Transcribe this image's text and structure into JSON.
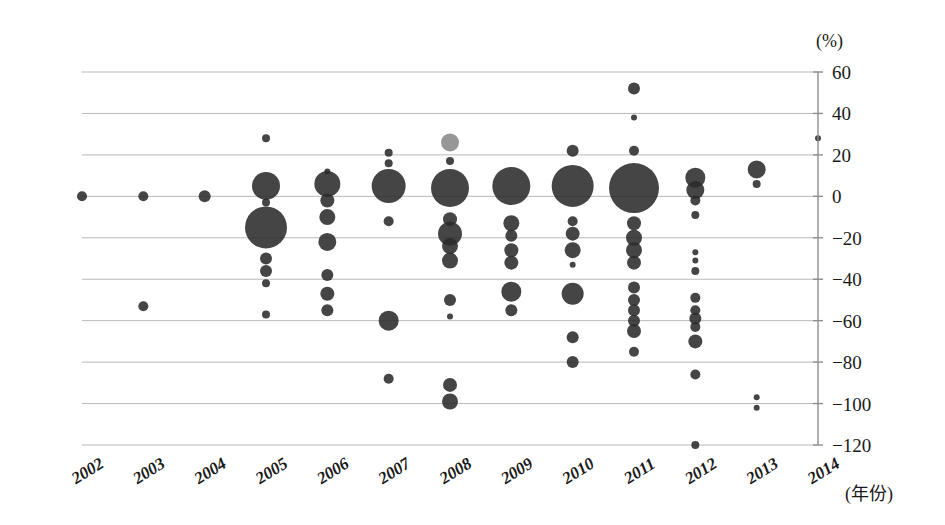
{
  "chart_data": {
    "type": "scatter",
    "title": "",
    "subtitle": "",
    "xlabel": "(年份)",
    "ylabel": "(%)",
    "y_unit": "(%)",
    "categories": [
      "2002",
      "2003",
      "2004",
      "2005",
      "2006",
      "2007",
      "2008",
      "2009",
      "2010",
      "2011",
      "2012",
      "2013",
      "2014"
    ],
    "xlim": [
      2002,
      2014
    ],
    "ylim": [
      -120,
      60
    ],
    "y_ticks": [
      60,
      40,
      20,
      0,
      -20,
      -40,
      -60,
      -80,
      -100,
      -120
    ],
    "y_tick_labels": [
      "60",
      "40",
      "20",
      "0",
      "-20",
      "-40",
      "-60",
      "-80",
      "-100",
      "-120"
    ],
    "grid": true,
    "legend": "none",
    "marker_note": "bubble size encodes magnitude",
    "series": [
      {
        "name": "2002",
        "points": [
          {
            "y": 0,
            "size": 5,
            "shade": "dark"
          }
        ]
      },
      {
        "name": "2003",
        "points": [
          {
            "y": 0,
            "size": 5,
            "shade": "dark"
          },
          {
            "y": -53,
            "size": 5,
            "shade": "dark"
          }
        ]
      },
      {
        "name": "2004",
        "points": [
          {
            "y": 0,
            "size": 6,
            "shade": "dark"
          }
        ]
      },
      {
        "name": "2005",
        "points": [
          {
            "y": 28,
            "size": 4,
            "shade": "dark"
          },
          {
            "y": 5,
            "size": 14,
            "shade": "dark"
          },
          {
            "y": -3,
            "size": 4,
            "shade": "dark"
          },
          {
            "y": -15,
            "size": 21,
            "shade": "dark"
          },
          {
            "y": -30,
            "size": 6,
            "shade": "dark"
          },
          {
            "y": -36,
            "size": 6,
            "shade": "dark"
          },
          {
            "y": -42,
            "size": 4,
            "shade": "dark"
          },
          {
            "y": -57,
            "size": 4,
            "shade": "dark"
          }
        ]
      },
      {
        "name": "2006",
        "points": [
          {
            "y": 12,
            "size": 3,
            "shade": "dark"
          },
          {
            "y": 6,
            "size": 13,
            "shade": "dark"
          },
          {
            "y": -2,
            "size": 7,
            "shade": "dark"
          },
          {
            "y": -10,
            "size": 8,
            "shade": "dark"
          },
          {
            "y": -22,
            "size": 9,
            "shade": "dark"
          },
          {
            "y": -38,
            "size": 6,
            "shade": "dark"
          },
          {
            "y": -47,
            "size": 7,
            "shade": "dark"
          },
          {
            "y": -55,
            "size": 6,
            "shade": "dark"
          }
        ]
      },
      {
        "name": "2007",
        "points": [
          {
            "y": 21,
            "size": 4,
            "shade": "dark"
          },
          {
            "y": 16,
            "size": 4,
            "shade": "dark"
          },
          {
            "y": 5,
            "size": 17,
            "shade": "dark"
          },
          {
            "y": -12,
            "size": 5,
            "shade": "dark"
          },
          {
            "y": -60,
            "size": 10,
            "shade": "dark"
          },
          {
            "y": -88,
            "size": 5,
            "shade": "dark"
          }
        ]
      },
      {
        "name": "2008",
        "points": [
          {
            "y": 26,
            "size": 9,
            "shade": "light"
          },
          {
            "y": 17,
            "size": 4,
            "shade": "dark"
          },
          {
            "y": 4,
            "size": 19,
            "shade": "dark"
          },
          {
            "y": -11,
            "size": 7,
            "shade": "dark"
          },
          {
            "y": -18,
            "size": 12,
            "shade": "dark"
          },
          {
            "y": -24,
            "size": 8,
            "shade": "dark"
          },
          {
            "y": -31,
            "size": 8,
            "shade": "dark"
          },
          {
            "y": -50,
            "size": 6,
            "shade": "dark"
          },
          {
            "y": -58,
            "size": 3,
            "shade": "dark"
          },
          {
            "y": -91,
            "size": 7,
            "shade": "dark"
          },
          {
            "y": -99,
            "size": 8,
            "shade": "dark"
          }
        ]
      },
      {
        "name": "2009",
        "points": [
          {
            "y": 5,
            "size": 19,
            "shade": "dark"
          },
          {
            "y": -13,
            "size": 8,
            "shade": "dark"
          },
          {
            "y": -19,
            "size": 6,
            "shade": "dark"
          },
          {
            "y": -26,
            "size": 7,
            "shade": "dark"
          },
          {
            "y": -32,
            "size": 7,
            "shade": "dark"
          },
          {
            "y": -46,
            "size": 10,
            "shade": "dark"
          },
          {
            "y": -55,
            "size": 6,
            "shade": "dark"
          }
        ]
      },
      {
        "name": "2010",
        "points": [
          {
            "y": 22,
            "size": 6,
            "shade": "dark"
          },
          {
            "y": 5,
            "size": 21,
            "shade": "dark"
          },
          {
            "y": -12,
            "size": 5,
            "shade": "dark"
          },
          {
            "y": -18,
            "size": 7,
            "shade": "dark"
          },
          {
            "y": -26,
            "size": 8,
            "shade": "dark"
          },
          {
            "y": -33,
            "size": 3,
            "shade": "dark"
          },
          {
            "y": -47,
            "size": 11,
            "shade": "dark"
          },
          {
            "y": -68,
            "size": 6,
            "shade": "dark"
          },
          {
            "y": -80,
            "size": 6,
            "shade": "dark"
          }
        ]
      },
      {
        "name": "2011",
        "points": [
          {
            "y": 52,
            "size": 6,
            "shade": "dark"
          },
          {
            "y": 38,
            "size": 3,
            "shade": "dark"
          },
          {
            "y": 22,
            "size": 5,
            "shade": "dark"
          },
          {
            "y": 4,
            "size": 25,
            "shade": "dark"
          },
          {
            "y": -13,
            "size": 7,
            "shade": "dark"
          },
          {
            "y": -20,
            "size": 8,
            "shade": "dark"
          },
          {
            "y": -26,
            "size": 8,
            "shade": "dark"
          },
          {
            "y": -32,
            "size": 7,
            "shade": "dark"
          },
          {
            "y": -44,
            "size": 6,
            "shade": "dark"
          },
          {
            "y": -50,
            "size": 6,
            "shade": "dark"
          },
          {
            "y": -55,
            "size": 6,
            "shade": "dark"
          },
          {
            "y": -60,
            "size": 6,
            "shade": "dark"
          },
          {
            "y": -65,
            "size": 7,
            "shade": "dark"
          },
          {
            "y": -75,
            "size": 5,
            "shade": "dark"
          }
        ]
      },
      {
        "name": "2012",
        "points": [
          {
            "y": 9,
            "size": 10,
            "shade": "dark"
          },
          {
            "y": 3,
            "size": 9,
            "shade": "dark"
          },
          {
            "y": -2,
            "size": 5,
            "shade": "dark"
          },
          {
            "y": -9,
            "size": 4,
            "shade": "dark"
          },
          {
            "y": -27,
            "size": 3,
            "shade": "dark"
          },
          {
            "y": -31,
            "size": 3,
            "shade": "dark"
          },
          {
            "y": -36,
            "size": 4,
            "shade": "dark"
          },
          {
            "y": -49,
            "size": 5,
            "shade": "dark"
          },
          {
            "y": -55,
            "size": 5,
            "shade": "dark"
          },
          {
            "y": -59,
            "size": 6,
            "shade": "dark"
          },
          {
            "y": -63,
            "size": 5,
            "shade": "dark"
          },
          {
            "y": -70,
            "size": 7,
            "shade": "dark"
          },
          {
            "y": -86,
            "size": 5,
            "shade": "dark"
          },
          {
            "y": -120,
            "size": 4,
            "shade": "dark"
          }
        ]
      },
      {
        "name": "2013",
        "points": [
          {
            "y": 13,
            "size": 9,
            "shade": "dark"
          },
          {
            "y": 6,
            "size": 4,
            "shade": "dark"
          },
          {
            "y": -97,
            "size": 3,
            "shade": "dark"
          },
          {
            "y": -102,
            "size": 3,
            "shade": "dark"
          }
        ]
      },
      {
        "name": "2014",
        "points": []
      }
    ],
    "axis_extra_points": [
      {
        "x": 2014,
        "y": 28,
        "size": 3,
        "shade": "dark"
      }
    ]
  }
}
